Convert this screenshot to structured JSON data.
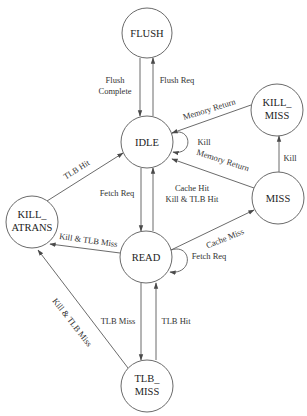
{
  "diagram": {
    "type": "state-machine",
    "colors": {
      "background": "#ffffff",
      "stroke": "#6a6a6a",
      "text": "#222222"
    },
    "nodes": [
      {
        "id": "FLUSH",
        "lines": [
          "FLUSH"
        ],
        "cx": 147,
        "cy": 33
      },
      {
        "id": "IDLE",
        "lines": [
          "IDLE"
        ],
        "cx": 147,
        "cy": 142
      },
      {
        "id": "KILL_MISS",
        "lines": [
          "KILL_",
          "MISS"
        ],
        "cx": 277,
        "cy": 110
      },
      {
        "id": "MISS",
        "lines": [
          "MISS"
        ],
        "cx": 278,
        "cy": 198
      },
      {
        "id": "KILL_ATRANS",
        "lines": [
          "KILL_",
          "ATRANS"
        ],
        "cx": 32,
        "cy": 222
      },
      {
        "id": "READ",
        "lines": [
          "READ"
        ],
        "cx": 146,
        "cy": 257
      },
      {
        "id": "TLB_MISS",
        "lines": [
          "TLB_",
          "MISS"
        ],
        "cx": 147,
        "cy": 386
      }
    ],
    "edges": [
      {
        "from": "FLUSH",
        "to": "IDLE",
        "label": [
          "Flush",
          "Complete"
        ]
      },
      {
        "from": "IDLE",
        "to": "FLUSH",
        "label": [
          "Flush Req"
        ]
      },
      {
        "from": "IDLE",
        "to": "IDLE",
        "label": [
          "Kill"
        ]
      },
      {
        "from": "KILL_MISS",
        "to": "IDLE",
        "label": [
          "Memory Return"
        ]
      },
      {
        "from": "MISS",
        "to": "IDLE",
        "label": [
          "Memory Return"
        ]
      },
      {
        "from": "MISS",
        "to": "KILL_MISS",
        "label": [
          "Kill"
        ]
      },
      {
        "from": "IDLE",
        "to": "READ",
        "label": [
          "Fetch Req"
        ]
      },
      {
        "from": "READ",
        "to": "IDLE",
        "label": [
          "Cache Hit",
          "Kill & TLB Hit"
        ]
      },
      {
        "from": "KILL_ATRANS",
        "to": "IDLE",
        "label": [
          "TLB Hit"
        ]
      },
      {
        "from": "READ",
        "to": "KILL_ATRANS",
        "label": [
          "Kill & TLB Miss"
        ]
      },
      {
        "from": "READ",
        "to": "MISS",
        "label": [
          "Cache Miss"
        ]
      },
      {
        "from": "READ",
        "to": "READ",
        "label": [
          "Fetch Req"
        ]
      },
      {
        "from": "READ",
        "to": "TLB_MISS",
        "label": [
          "TLB Miss"
        ]
      },
      {
        "from": "TLB_MISS",
        "to": "READ",
        "label": [
          "TLB Hit"
        ]
      },
      {
        "from": "TLB_MISS",
        "to": "KILL_ATRANS",
        "label": [
          "Kill & TLB Miss"
        ]
      }
    ]
  },
  "labels": {
    "n_flush": "FLUSH",
    "n_idle": "IDLE",
    "n_killmiss_1": "KILL_",
    "n_killmiss_2": "MISS",
    "n_miss": "MISS",
    "n_killatrans_1": "KILL_",
    "n_killatrans_2": "ATRANS",
    "n_read": "READ",
    "n_tlbmiss_1": "TLB_",
    "n_tlbmiss_2": "MISS",
    "e_flush_complete_1": "Flush",
    "e_flush_complete_2": "Complete",
    "e_flush_req": "Flush Req",
    "e_idle_kill": "Kill",
    "e_killmiss_memret": "Memory Return",
    "e_miss_memret": "Memory Return",
    "e_miss_kill": "Kill",
    "e_fetch_req": "Fetch Req",
    "e_cache_hit_1": "Cache Hit",
    "e_cache_hit_2": "Kill & TLB Hit",
    "e_tlb_hit_katrans": "TLB Hit",
    "e_read_kill_tlbmiss": "Kill & TLB Miss",
    "e_cache_miss": "Cache Miss",
    "e_read_fetch_req": "Fetch Req",
    "e_tlb_miss": "TLB Miss",
    "e_tlb_hit": "TLB Hit",
    "e_tlbmiss_kill": "Kill & TLB Miss"
  }
}
